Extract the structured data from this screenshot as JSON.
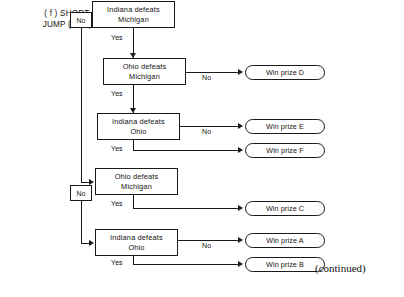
{
  "figure": {
    "caption_line1": "( f )  SHORT-",
    "caption_line2": "JUMP (Flow)",
    "continued_note": "(continued)"
  },
  "labels": {
    "no": "No",
    "yes": "Yes"
  },
  "decision_boxes": [
    {
      "id": "d1",
      "line1": "Indiana  defeats",
      "line2": "Michigan"
    },
    {
      "id": "d2",
      "line1": "Ohio defeats",
      "line2": "Michigan"
    },
    {
      "id": "d3",
      "line1": "Indiana  defeats",
      "line2": "Ohio"
    },
    {
      "id": "d4",
      "line1": "Ohio defeats",
      "line2": "Michigan"
    },
    {
      "id": "d5",
      "line1": "Indiana  defeats",
      "line2": "Ohio"
    }
  ],
  "outcomes": [
    {
      "id": "o_d",
      "label": "Win prize D"
    },
    {
      "id": "o_e",
      "label": "Win prize E"
    },
    {
      "id": "o_f",
      "label": "Win prize F"
    },
    {
      "id": "o_c",
      "label": "Win prize C"
    },
    {
      "id": "o_a",
      "label": "Win prize A"
    },
    {
      "id": "o_b",
      "label": "Win prize B"
    }
  ],
  "edge_labels": {
    "d1_no": "No",
    "d1_yes": "Yes",
    "d2_no": "No",
    "d2_yes": "Yes",
    "d3_no": "No",
    "d3_yes": "Yes",
    "d4_no": "No",
    "d4_yes": "Yes",
    "d5_no": "No",
    "d5_yes": "Yes"
  },
  "colors": {
    "stroke": "#1a1a1a",
    "background": "#ffffff",
    "text": "#111111"
  }
}
